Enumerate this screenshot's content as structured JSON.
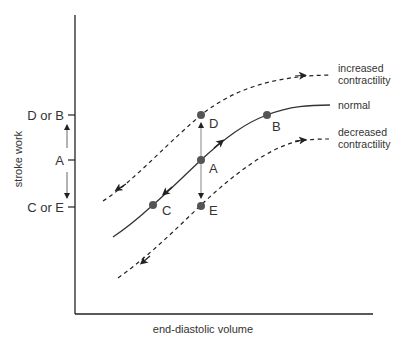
{
  "diagram": {
    "title": "",
    "axes": {
      "x_label": "end-diastolic volume",
      "y_label": "stroke work"
    },
    "y_ticks": [
      {
        "label": "D or B"
      },
      {
        "label": "A"
      },
      {
        "label": "C or E"
      }
    ],
    "curves": [
      {
        "name": "increased-contractility",
        "label_line1": "increased",
        "label_line2": "contractility",
        "style": "dashed"
      },
      {
        "name": "normal",
        "label_line1": "normal",
        "style": "solid"
      },
      {
        "name": "decreased-contractility",
        "label_line1": "decreased",
        "label_line2": "contractility",
        "style": "dashed"
      }
    ],
    "points": [
      {
        "id": "A",
        "label": "A"
      },
      {
        "id": "B",
        "label": "B"
      },
      {
        "id": "C",
        "label": "C"
      },
      {
        "id": "D",
        "label": "D"
      },
      {
        "id": "E",
        "label": "E"
      }
    ],
    "colors": {
      "line": "#333333",
      "point": "#555555",
      "arrow_line": "#999999"
    }
  }
}
